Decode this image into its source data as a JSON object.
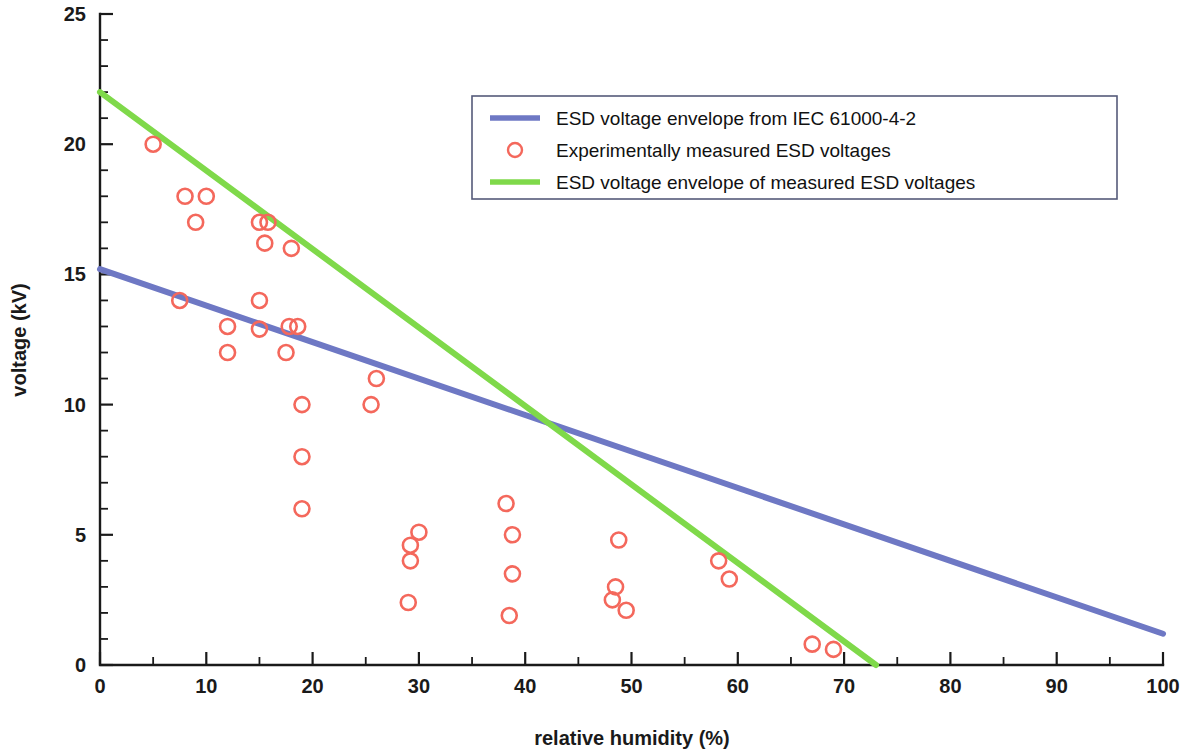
{
  "chart_data": {
    "type": "scatter",
    "title": "",
    "xlabel": "relative humidity (%)",
    "ylabel": "voltage (kV)",
    "xlim": [
      0,
      100
    ],
    "ylim": [
      0,
      25
    ],
    "grid": false,
    "x_ticks": [
      0,
      10,
      20,
      30,
      40,
      50,
      60,
      70,
      80,
      90,
      100
    ],
    "x_tick_labels": [
      "0",
      "10",
      "20",
      "30",
      "40",
      "50",
      "60",
      "70",
      "80",
      "90",
      "100"
    ],
    "x_minor_step": 5,
    "y_ticks": [
      0,
      5,
      10,
      15,
      20,
      25
    ],
    "y_tick_labels": [
      "0",
      "5",
      "10",
      "15",
      "20",
      "25"
    ],
    "y_minor_step": 1,
    "legend_position": "upper-center",
    "series": [
      {
        "name": "ESD voltage envelope from IEC 61000-4-2",
        "type": "line",
        "color": "#6e78c4",
        "x": [
          0,
          100
        ],
        "values": [
          15.2,
          1.2
        ]
      },
      {
        "name": "Experimentally measured ESD voltages",
        "type": "scatter",
        "color": "#f4685c",
        "marker": "circle-open",
        "points": [
          [
            5.0,
            20.0
          ],
          [
            8.0,
            18.0
          ],
          [
            10.0,
            18.0
          ],
          [
            9.0,
            17.0
          ],
          [
            15.0,
            17.0
          ],
          [
            15.8,
            17.0
          ],
          [
            15.5,
            16.2
          ],
          [
            18.0,
            16.0
          ],
          [
            7.5,
            14.0
          ],
          [
            15.0,
            14.0
          ],
          [
            12.0,
            13.0
          ],
          [
            15.0,
            12.9
          ],
          [
            17.8,
            13.0
          ],
          [
            18.6,
            13.0
          ],
          [
            12.0,
            12.0
          ],
          [
            17.5,
            12.0
          ],
          [
            26.0,
            11.0
          ],
          [
            19.0,
            10.0
          ],
          [
            25.5,
            10.0
          ],
          [
            19.0,
            8.0
          ],
          [
            19.0,
            6.0
          ],
          [
            38.2,
            6.2
          ],
          [
            30.0,
            5.1
          ],
          [
            38.8,
            5.0
          ],
          [
            48.8,
            4.8
          ],
          [
            29.2,
            4.6
          ],
          [
            29.2,
            4.0
          ],
          [
            58.2,
            4.0
          ],
          [
            38.8,
            3.5
          ],
          [
            59.2,
            3.3
          ],
          [
            48.5,
            3.0
          ],
          [
            48.2,
            2.5
          ],
          [
            29.0,
            2.4
          ],
          [
            49.5,
            2.1
          ],
          [
            38.5,
            1.9
          ],
          [
            67.0,
            0.8
          ],
          [
            69.0,
            0.6
          ]
        ]
      },
      {
        "name": "ESD voltage envelope of measured ESD voltages",
        "type": "line",
        "color": "#7fd94a",
        "x": [
          0,
          73
        ],
        "values": [
          22.0,
          0.0
        ]
      }
    ]
  },
  "legend": {
    "entries": [
      {
        "label": "ESD voltage envelope from IEC 61000-4-2",
        "kind": "line",
        "color": "#6e78c4"
      },
      {
        "label": "Experimentally measured ESD voltages",
        "kind": "marker",
        "color": "#f4685c"
      },
      {
        "label": "ESD voltage envelope of measured ESD voltages",
        "kind": "line",
        "color": "#7fd94a"
      }
    ]
  },
  "axes": {
    "x_title": "relative humidity (%)",
    "y_title": "voltage (kV)"
  },
  "colors": {
    "axis": "#1a1a1a",
    "blue_envelope": "#6e78c4",
    "green_envelope": "#7fd94a",
    "marker": "#f4685c",
    "legend_border": "#555b7a",
    "background": "#ffffff"
  }
}
